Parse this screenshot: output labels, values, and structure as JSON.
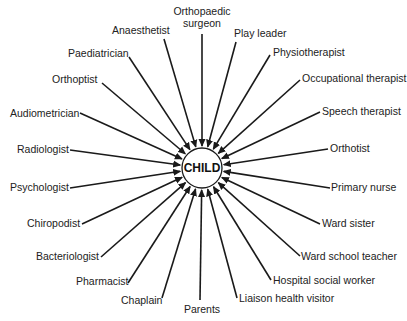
{
  "diagram": {
    "center": {
      "label": "CHILD",
      "x": 202,
      "y": 168,
      "r": 20
    },
    "colors": {
      "line": "#1a1a1a",
      "text": "#222222",
      "background": "#ffffff"
    },
    "nodes": [
      {
        "label": "Orthopaedic",
        "label2": "surgeon",
        "tx": 202,
        "ty": 15,
        "anchor": "middle",
        "sx": 202,
        "sy": 34
      },
      {
        "label": "Anaesthetist",
        "tx": 112,
        "ty": 34,
        "anchor": "start",
        "sx": 164,
        "sy": 39
      },
      {
        "label": "Play leader",
        "tx": 234,
        "ty": 37,
        "anchor": "start",
        "sx": 236,
        "sy": 42
      },
      {
        "label": "Paediatrician",
        "tx": 68,
        "ty": 57,
        "anchor": "start",
        "sx": 129,
        "sy": 57
      },
      {
        "label": "Physiotherapist",
        "tx": 273,
        "ty": 56,
        "anchor": "start",
        "sx": 270,
        "sy": 55
      },
      {
        "label": "Orthoptist",
        "tx": 52,
        "ty": 83,
        "anchor": "start",
        "sx": 102,
        "sy": 83
      },
      {
        "label": "Occupational therapist",
        "tx": 302,
        "ty": 82,
        "anchor": "start",
        "sx": 300,
        "sy": 80
      },
      {
        "label": "Audiometrician",
        "tx": 10,
        "ty": 117,
        "anchor": "start",
        "sx": 80,
        "sy": 113
      },
      {
        "label": "Speech therapist",
        "tx": 322,
        "ty": 115,
        "anchor": "start",
        "sx": 320,
        "sy": 112
      },
      {
        "label": "Radiologist",
        "tx": 17,
        "ty": 153,
        "anchor": "start",
        "sx": 70,
        "sy": 150
      },
      {
        "label": "Orthotist",
        "tx": 330,
        "ty": 152,
        "anchor": "start",
        "sx": 328,
        "sy": 149
      },
      {
        "label": "Psychologist",
        "tx": 10,
        "ty": 191,
        "anchor": "start",
        "sx": 70,
        "sy": 188
      },
      {
        "label": "Primary nurse",
        "tx": 331,
        "ty": 191,
        "anchor": "start",
        "sx": 330,
        "sy": 188
      },
      {
        "label": "Chiropodist",
        "tx": 27,
        "ty": 227,
        "anchor": "start",
        "sx": 82,
        "sy": 224
      },
      {
        "label": "Ward sister",
        "tx": 322,
        "ty": 227,
        "anchor": "start",
        "sx": 320,
        "sy": 224
      },
      {
        "label": "Bacteriologist",
        "tx": 36,
        "ty": 260,
        "anchor": "start",
        "sx": 101,
        "sy": 257
      },
      {
        "label": "Ward school teacher",
        "tx": 301,
        "ty": 260,
        "anchor": "start",
        "sx": 300,
        "sy": 256
      },
      {
        "label": "Pharmacist",
        "tx": 76,
        "ty": 285,
        "anchor": "start",
        "sx": 128,
        "sy": 283
      },
      {
        "label": "Hospital social worker",
        "tx": 273,
        "ty": 284,
        "anchor": "start",
        "sx": 271,
        "sy": 280
      },
      {
        "label": "Chaplain",
        "tx": 121,
        "ty": 304,
        "anchor": "start",
        "sx": 162,
        "sy": 298
      },
      {
        "label": "Liaison health visitor",
        "tx": 239,
        "ty": 302,
        "anchor": "start",
        "sx": 237,
        "sy": 298
      },
      {
        "label": "Parents",
        "tx": 202,
        "ty": 313,
        "anchor": "middle",
        "sx": 200,
        "sy": 300
      }
    ]
  }
}
